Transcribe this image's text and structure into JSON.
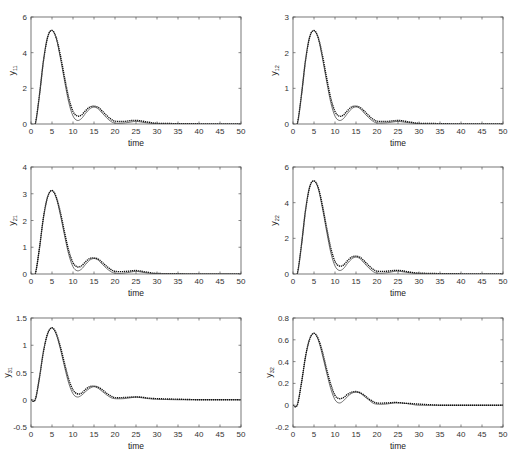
{
  "figure": {
    "width": 519,
    "height": 462,
    "line_color": "#333333",
    "dotted_color": "#111111",
    "axis_color": "#555555"
  },
  "chart_data": [
    {
      "type": "line",
      "id": "y11",
      "ylabel": "y",
      "ylabel_sub": "11",
      "xlabel": "time",
      "xlim": [
        0,
        50
      ],
      "ylim": [
        0,
        6
      ],
      "xticks": [
        0,
        5,
        10,
        15,
        20,
        25,
        30,
        35,
        40,
        45,
        50
      ],
      "yticks": [
        0,
        2,
        4,
        6
      ],
      "grid": false,
      "box": {
        "x": 31,
        "y": 17,
        "w": 210,
        "h": 107
      },
      "series": [
        {
          "name": "reference",
          "style": "solid",
          "x": [
            0,
            1,
            2,
            3,
            4,
            5,
            6,
            7,
            8,
            9,
            10,
            11,
            12,
            13,
            14,
            15,
            16,
            17,
            18,
            19,
            20,
            22,
            24,
            25,
            26,
            28,
            30,
            35,
            40,
            45,
            50
          ],
          "y": [
            0,
            0,
            1.6,
            3.6,
            4.9,
            5.25,
            4.8,
            3.7,
            2.4,
            1.2,
            0.45,
            0.2,
            0.3,
            0.6,
            0.85,
            0.95,
            0.85,
            0.6,
            0.35,
            0.15,
            0.05,
            0.05,
            0.12,
            0.15,
            0.12,
            0.05,
            0.02,
            0.01,
            0.0,
            0.0,
            0.0
          ]
        },
        {
          "name": "output",
          "style": "dotted",
          "x": [
            0,
            1,
            2,
            3,
            4,
            5,
            6,
            7,
            8,
            9,
            10,
            11,
            12,
            13,
            14,
            15,
            16,
            17,
            18,
            19,
            20,
            22,
            24,
            25,
            26,
            28,
            30,
            35,
            40,
            45,
            50
          ],
          "y": [
            0,
            0,
            1.6,
            3.6,
            4.9,
            5.25,
            4.85,
            3.85,
            2.6,
            1.45,
            0.7,
            0.45,
            0.5,
            0.75,
            0.95,
            1.0,
            0.93,
            0.72,
            0.48,
            0.28,
            0.16,
            0.14,
            0.2,
            0.2,
            0.18,
            0.1,
            0.04,
            0.02,
            0.01,
            0.0,
            0.0
          ]
        }
      ]
    },
    {
      "type": "line",
      "id": "y12",
      "ylabel": "y",
      "ylabel_sub": "12",
      "xlabel": "time",
      "xlim": [
        0,
        50
      ],
      "ylim": [
        0,
        3
      ],
      "xticks": [
        0,
        5,
        10,
        15,
        20,
        25,
        30,
        35,
        40,
        45,
        50
      ],
      "yticks": [
        0,
        1,
        2,
        3
      ],
      "grid": false,
      "box": {
        "x": 293,
        "y": 17,
        "w": 210,
        "h": 107
      },
      "series": [
        {
          "name": "reference",
          "style": "solid",
          "x": [
            0,
            1,
            2,
            3,
            4,
            5,
            6,
            7,
            8,
            9,
            10,
            11,
            12,
            13,
            14,
            15,
            16,
            17,
            18,
            19,
            20,
            22,
            24,
            25,
            26,
            28,
            30,
            35,
            40,
            45,
            50
          ],
          "y": [
            0,
            0,
            0.8,
            1.8,
            2.45,
            2.62,
            2.4,
            1.85,
            1.2,
            0.6,
            0.22,
            0.1,
            0.15,
            0.3,
            0.43,
            0.48,
            0.43,
            0.3,
            0.18,
            0.08,
            0.03,
            0.03,
            0.06,
            0.07,
            0.06,
            0.03,
            0.01,
            0.0,
            0.0,
            0.0,
            0.0
          ]
        },
        {
          "name": "output",
          "style": "dotted",
          "x": [
            0,
            1,
            2,
            3,
            4,
            5,
            6,
            7,
            8,
            9,
            10,
            11,
            12,
            13,
            14,
            15,
            16,
            17,
            18,
            19,
            20,
            22,
            24,
            25,
            26,
            28,
            30,
            35,
            40,
            45,
            50
          ],
          "y": [
            0,
            0,
            0.8,
            1.8,
            2.45,
            2.62,
            2.43,
            1.93,
            1.3,
            0.72,
            0.35,
            0.22,
            0.25,
            0.38,
            0.48,
            0.5,
            0.46,
            0.36,
            0.24,
            0.14,
            0.08,
            0.07,
            0.09,
            0.1,
            0.09,
            0.05,
            0.02,
            0.01,
            0.0,
            0.0,
            0.0
          ]
        }
      ]
    },
    {
      "type": "line",
      "id": "y21",
      "ylabel": "y",
      "ylabel_sub": "21",
      "xlabel": "time",
      "xlim": [
        0,
        50
      ],
      "ylim": [
        0,
        4
      ],
      "xticks": [
        0,
        5,
        10,
        15,
        20,
        25,
        30,
        35,
        40,
        45,
        50
      ],
      "yticks": [
        0,
        1,
        2,
        3,
        4
      ],
      "grid": false,
      "box": {
        "x": 31,
        "y": 167,
        "w": 210,
        "h": 107
      },
      "series": [
        {
          "name": "reference",
          "style": "solid",
          "x": [
            0,
            1,
            2,
            3,
            4,
            5,
            6,
            7,
            8,
            9,
            10,
            11,
            12,
            13,
            14,
            15,
            16,
            17,
            18,
            19,
            20,
            22,
            24,
            25,
            26,
            28,
            30,
            35,
            40,
            45,
            50
          ],
          "y": [
            0,
            0,
            0.95,
            2.15,
            2.9,
            3.12,
            2.85,
            2.2,
            1.43,
            0.72,
            0.27,
            0.12,
            0.18,
            0.36,
            0.52,
            0.58,
            0.52,
            0.36,
            0.21,
            0.09,
            0.03,
            0.03,
            0.08,
            0.1,
            0.08,
            0.03,
            0.01,
            0.0,
            0.0,
            0.0,
            0.0
          ]
        },
        {
          "name": "output",
          "style": "dotted",
          "x": [
            0,
            1,
            2,
            3,
            4,
            5,
            6,
            7,
            8,
            9,
            10,
            11,
            12,
            13,
            14,
            15,
            16,
            17,
            18,
            19,
            20,
            22,
            24,
            25,
            26,
            28,
            30,
            35,
            40,
            45,
            50
          ],
          "y": [
            0,
            0,
            0.95,
            2.15,
            2.9,
            3.12,
            2.88,
            2.3,
            1.55,
            0.86,
            0.42,
            0.27,
            0.3,
            0.46,
            0.58,
            0.6,
            0.56,
            0.43,
            0.29,
            0.17,
            0.1,
            0.09,
            0.12,
            0.13,
            0.11,
            0.06,
            0.02,
            0.01,
            0.0,
            0.0,
            0.0
          ]
        }
      ]
    },
    {
      "type": "line",
      "id": "y22",
      "ylabel": "y",
      "ylabel_sub": "22",
      "xlabel": "time",
      "xlim": [
        0,
        50
      ],
      "ylim": [
        0,
        6
      ],
      "xticks": [
        0,
        5,
        10,
        15,
        20,
        25,
        30,
        35,
        40,
        45,
        50
      ],
      "yticks": [
        0,
        2,
        4,
        6
      ],
      "grid": false,
      "box": {
        "x": 293,
        "y": 167,
        "w": 210,
        "h": 107
      },
      "series": [
        {
          "name": "reference",
          "style": "solid",
          "x": [
            0,
            1,
            2,
            3,
            4,
            5,
            6,
            7,
            8,
            9,
            10,
            11,
            12,
            13,
            14,
            15,
            16,
            17,
            18,
            19,
            20,
            22,
            24,
            25,
            26,
            28,
            30,
            35,
            40,
            45,
            50
          ],
          "y": [
            0,
            0,
            1.6,
            3.6,
            4.9,
            5.22,
            4.8,
            3.7,
            2.4,
            1.2,
            0.45,
            0.2,
            0.3,
            0.6,
            0.85,
            0.95,
            0.85,
            0.6,
            0.35,
            0.15,
            0.05,
            0.06,
            0.14,
            0.16,
            0.13,
            0.06,
            0.02,
            0.01,
            0.0,
            0.0,
            0.0
          ]
        },
        {
          "name": "output",
          "style": "dotted",
          "x": [
            0,
            1,
            2,
            3,
            4,
            5,
            6,
            7,
            8,
            9,
            10,
            11,
            12,
            13,
            14,
            15,
            16,
            17,
            18,
            19,
            20,
            22,
            24,
            25,
            26,
            28,
            30,
            35,
            40,
            45,
            50
          ],
          "y": [
            0,
            0,
            1.6,
            3.6,
            4.9,
            5.22,
            4.85,
            3.85,
            2.6,
            1.45,
            0.7,
            0.45,
            0.5,
            0.75,
            0.95,
            1.0,
            0.93,
            0.72,
            0.48,
            0.28,
            0.16,
            0.15,
            0.2,
            0.2,
            0.18,
            0.1,
            0.05,
            0.02,
            0.01,
            0.0,
            0.0
          ]
        }
      ]
    },
    {
      "type": "line",
      "id": "y31",
      "ylabel": "y",
      "ylabel_sub": "31",
      "xlabel": "time",
      "xlim": [
        0,
        50
      ],
      "ylim": [
        -0.5,
        1.5
      ],
      "xticks": [
        0,
        5,
        10,
        15,
        20,
        25,
        30,
        35,
        40,
        45,
        50
      ],
      "yticks": [
        -0.5,
        0,
        0.5,
        1,
        1.5
      ],
      "grid": false,
      "box": {
        "x": 31,
        "y": 318,
        "w": 210,
        "h": 109
      },
      "series": [
        {
          "name": "reference",
          "style": "solid",
          "x": [
            0,
            1,
            2,
            3,
            4,
            5,
            6,
            7,
            8,
            9,
            10,
            11,
            12,
            13,
            14,
            15,
            16,
            17,
            18,
            19,
            20,
            22,
            24,
            25,
            26,
            28,
            30,
            35,
            40,
            45,
            50
          ],
          "y": [
            0,
            0,
            0.4,
            0.9,
            1.22,
            1.32,
            1.2,
            0.93,
            0.6,
            0.3,
            0.11,
            0.05,
            0.08,
            0.15,
            0.21,
            0.24,
            0.21,
            0.15,
            0.09,
            0.04,
            0.02,
            0.02,
            0.04,
            0.05,
            0.04,
            0.02,
            0.01,
            0.0,
            0.0,
            0.0,
            0.0
          ]
        },
        {
          "name": "output",
          "style": "dotted",
          "x": [
            0,
            1,
            2,
            3,
            4,
            5,
            6,
            7,
            8,
            9,
            10,
            11,
            12,
            13,
            14,
            15,
            16,
            17,
            18,
            19,
            20,
            22,
            24,
            25,
            26,
            28,
            30,
            35,
            40,
            45,
            50
          ],
          "y": [
            0,
            0,
            0.4,
            0.9,
            1.22,
            1.32,
            1.22,
            0.97,
            0.66,
            0.37,
            0.18,
            0.11,
            0.12,
            0.19,
            0.24,
            0.25,
            0.23,
            0.18,
            0.12,
            0.07,
            0.04,
            0.04,
            0.05,
            0.05,
            0.05,
            0.03,
            0.02,
            0.01,
            0.0,
            0.0,
            0.0
          ]
        }
      ]
    },
    {
      "type": "line",
      "id": "y32",
      "ylabel": "y",
      "ylabel_sub": "32",
      "xlabel": "time",
      "xlim": [
        0,
        50
      ],
      "ylim": [
        -0.2,
        0.8
      ],
      "xticks": [
        0,
        5,
        10,
        15,
        20,
        25,
        30,
        35,
        40,
        45,
        50
      ],
      "yticks": [
        -0.2,
        0,
        0.2,
        0.4,
        0.6,
        0.8
      ],
      "grid": false,
      "box": {
        "x": 293,
        "y": 318,
        "w": 210,
        "h": 109
      },
      "series": [
        {
          "name": "reference",
          "style": "solid",
          "x": [
            0,
            1,
            2,
            3,
            4,
            5,
            6,
            7,
            8,
            9,
            10,
            11,
            12,
            13,
            14,
            15,
            16,
            17,
            18,
            19,
            20,
            22,
            24,
            25,
            26,
            28,
            30,
            35,
            40,
            45,
            50
          ],
          "y": [
            0,
            0,
            0.2,
            0.45,
            0.61,
            0.66,
            0.6,
            0.46,
            0.3,
            0.15,
            0.05,
            0.02,
            0.04,
            0.08,
            0.11,
            0.12,
            0.11,
            0.08,
            0.05,
            0.02,
            0.01,
            0.01,
            0.02,
            0.02,
            0.02,
            0.01,
            0.0,
            0.0,
            0.0,
            0.0,
            0.0
          ]
        },
        {
          "name": "output",
          "style": "dotted",
          "x": [
            0,
            1,
            2,
            3,
            4,
            5,
            6,
            7,
            8,
            9,
            10,
            11,
            12,
            13,
            14,
            15,
            16,
            17,
            18,
            19,
            20,
            22,
            24,
            25,
            26,
            28,
            30,
            35,
            40,
            45,
            50
          ],
          "y": [
            0,
            0,
            0.2,
            0.45,
            0.61,
            0.66,
            0.61,
            0.49,
            0.33,
            0.19,
            0.09,
            0.06,
            0.07,
            0.1,
            0.12,
            0.125,
            0.115,
            0.09,
            0.06,
            0.035,
            0.02,
            0.02,
            0.025,
            0.025,
            0.02,
            0.015,
            0.01,
            0.0,
            0.0,
            0.0,
            0.0
          ]
        }
      ]
    }
  ]
}
